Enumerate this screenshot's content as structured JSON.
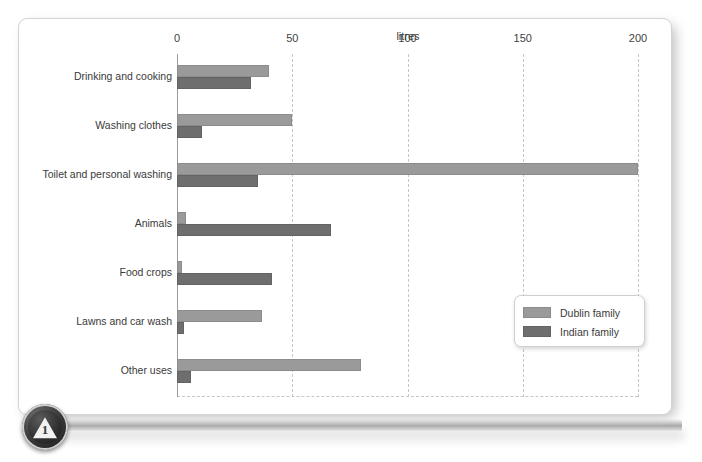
{
  "badge": {
    "number": "1"
  },
  "chart_data": {
    "type": "bar",
    "orientation": "horizontal",
    "title": "",
    "xlabel": "litres",
    "ylabel": "",
    "xlim": [
      0,
      200
    ],
    "xticks": [
      0,
      50,
      100,
      150,
      200
    ],
    "xtick_labels": [
      "0",
      "50",
      "100",
      "150",
      "200"
    ],
    "grid": "vertical-dashed",
    "legend_position": "center-right",
    "categories": [
      "Drinking and cooking",
      "Washing clothes",
      "Toilet and personal washing",
      "Animals",
      "Food crops",
      "Lawns and car wash",
      "Other uses"
    ],
    "series": [
      {
        "name": "Dublin family",
        "color": "#9a9a9a",
        "values": [
          40,
          50,
          200,
          4,
          2,
          37,
          80
        ]
      },
      {
        "name": "Indian family",
        "color": "#6e6e6e",
        "values": [
          32,
          11,
          35,
          67,
          41,
          3,
          6
        ]
      }
    ]
  }
}
